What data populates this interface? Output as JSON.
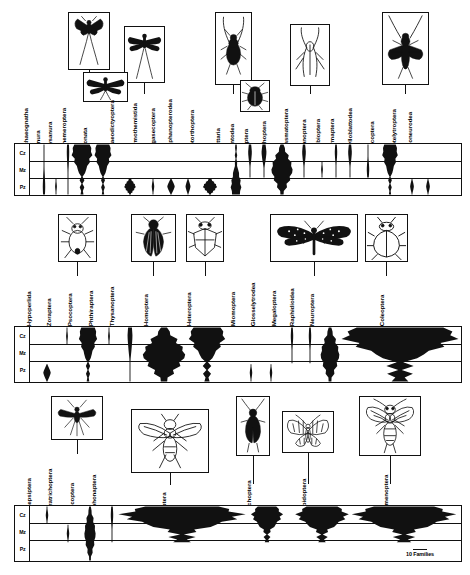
{
  "figure": {
    "scale_bar": {
      "label": "10 Families",
      "units": 10
    }
  },
  "eras": [
    {
      "abbr": "Cz",
      "name": "Cenozoic"
    },
    {
      "abbr": "Mz",
      "name": "Mesozoic"
    },
    {
      "abbr": "Pz",
      "name": "Paleozoic"
    }
  ],
  "chart_data": {
    "type": "area",
    "xlabel": "Insect orders",
    "ylabel": "Geologic era",
    "grid": true,
    "legend": "none",
    "orientation": "vertical-spindle",
    "y_categories": [
      "Cz",
      "Mz",
      "Pz"
    ],
    "scale_note": "Spindle width proportional to number of families; scale bar = 10 Families",
    "panels": [
      {
        "index": 1,
        "categories": [
          "Archaeognatha",
          "Monura",
          "Thysanura",
          "Ephemeroptera",
          "Odonata",
          "Palaeodictyoptera",
          "Permothemistida",
          "Megasecoptera",
          "Diaphanopterodea",
          "Protorthoptera",
          "Blattaria",
          "Mantodea",
          "Isoptera",
          "Orthoptera",
          "Phasmatoptera",
          "Titanoptera",
          "Embioptera",
          "Dermaptera",
          "Grylloblattodea",
          "Plecoptera",
          "Protelytroptera",
          "Caloneurodea"
        ],
        "series": [
          {
            "name": "Archaeognatha",
            "range": [
              "Pz",
              "Cz"
            ],
            "peak_families": 2,
            "peak_era": "Pz"
          },
          {
            "name": "Monura",
            "range": [
              "Pz",
              "Pz"
            ],
            "peak_families": 1,
            "peak_era": "Pz"
          },
          {
            "name": "Thysanura",
            "range": [
              "Pz",
              "Cz"
            ],
            "peak_families": 2,
            "peak_era": "Cz"
          },
          {
            "name": "Ephemeroptera",
            "range": [
              "Pz",
              "Cz"
            ],
            "peak_families": 16,
            "peak_era": "Cz"
          },
          {
            "name": "Odonata",
            "range": [
              "Pz",
              "Cz"
            ],
            "peak_families": 13,
            "peak_era": "Cz"
          },
          {
            "name": "Palaeodictyoptera",
            "range": [
              "Pz",
              "Pz"
            ],
            "peak_families": 9,
            "peak_era": "Pz"
          },
          {
            "name": "Permothemistida",
            "range": [
              "Pz",
              "Pz"
            ],
            "peak_families": 2,
            "peak_era": "Pz"
          },
          {
            "name": "Megasecoptera",
            "range": [
              "Pz",
              "Pz"
            ],
            "peak_families": 6,
            "peak_era": "Pz"
          },
          {
            "name": "Diaphanopterodea",
            "range": [
              "Pz",
              "Pz"
            ],
            "peak_families": 4,
            "peak_era": "Pz"
          },
          {
            "name": "Protorthoptera",
            "range": [
              "Pz",
              "Pz"
            ],
            "peak_families": 11,
            "peak_era": "Pz"
          },
          {
            "name": "Blattaria",
            "range": [
              "Pz",
              "Cz"
            ],
            "peak_families": 8,
            "peak_era": "Pz"
          },
          {
            "name": "Mantodea",
            "range": [
              "Mz",
              "Cz"
            ],
            "peak_families": 3,
            "peak_era": "Cz"
          },
          {
            "name": "Isoptera",
            "range": [
              "Mz",
              "Cz"
            ],
            "peak_families": 4,
            "peak_era": "Cz"
          },
          {
            "name": "Orthoptera",
            "range": [
              "Pz",
              "Cz"
            ],
            "peak_families": 17,
            "peak_era": "Mz"
          },
          {
            "name": "Phasmatoptera",
            "range": [
              "Mz",
              "Cz"
            ],
            "peak_families": 3,
            "peak_era": "Cz"
          },
          {
            "name": "Titanoptera",
            "range": [
              "Mz",
              "Mz"
            ],
            "peak_families": 1,
            "peak_era": "Mz"
          },
          {
            "name": "Embioptera",
            "range": [
              "Mz",
              "Cz"
            ],
            "peak_families": 2,
            "peak_era": "Cz"
          },
          {
            "name": "Dermaptera",
            "range": [
              "Mz",
              "Cz"
            ],
            "peak_families": 3,
            "peak_era": "Cz"
          },
          {
            "name": "Grylloblattodea",
            "range": [
              "Mz",
              "Cz"
            ],
            "peak_families": 2,
            "peak_era": "Mz"
          },
          {
            "name": "Plecoptera",
            "range": [
              "Pz",
              "Cz"
            ],
            "peak_families": 12,
            "peak_era": "Cz"
          },
          {
            "name": "Protelytroptera",
            "range": [
              "Pz",
              "Pz"
            ],
            "peak_families": 3,
            "peak_era": "Pz"
          },
          {
            "name": "Caloneurodea",
            "range": [
              "Pz",
              "Pz"
            ],
            "peak_families": 3,
            "peak_era": "Pz"
          }
        ]
      },
      {
        "index": 2,
        "categories": [
          "Hypoperlida",
          "Zoraptera",
          "Psocoptera",
          "Phthiraptera",
          "Thysanoptera",
          "Homoptera",
          "Heteroptera",
          "Miomoptera",
          "Glosselytrodea",
          "Megaloptera",
          "Raphidioidea",
          "Neuroptera",
          "Coleoptera"
        ],
        "series": [
          {
            "name": "Hypoperlida",
            "range": [
              "Pz",
              "Pz"
            ],
            "peak_families": 6,
            "peak_era": "Pz"
          },
          {
            "name": "Zoraptera",
            "range": [
              "Cz",
              "Cz"
            ],
            "peak_families": 1,
            "peak_era": "Cz"
          },
          {
            "name": "Psocoptera",
            "range": [
              "Pz",
              "Cz"
            ],
            "peak_families": 14,
            "peak_era": "Cz"
          },
          {
            "name": "Phthiraptera",
            "range": [
              "Cz",
              "Cz"
            ],
            "peak_families": 1,
            "peak_era": "Cz"
          },
          {
            "name": "Thysanoptera",
            "range": [
              "Pz",
              "Cz"
            ],
            "peak_families": 4,
            "peak_era": "Cz"
          },
          {
            "name": "Homoptera",
            "range": [
              "Pz",
              "Cz"
            ],
            "peak_families": 34,
            "peak_era": "Mz"
          },
          {
            "name": "Heteroptera",
            "range": [
              "Pz",
              "Cz"
            ],
            "peak_families": 28,
            "peak_era": "Cz"
          },
          {
            "name": "Miomoptera",
            "range": [
              "Pz",
              "Pz"
            ],
            "peak_families": 2,
            "peak_era": "Pz"
          },
          {
            "name": "Glosselytrodea",
            "range": [
              "Pz",
              "Pz"
            ],
            "peak_families": 2,
            "peak_era": "Pz"
          },
          {
            "name": "Megaloptera",
            "range": [
              "Mz",
              "Cz"
            ],
            "peak_families": 2,
            "peak_era": "Cz"
          },
          {
            "name": "Raphidioidea",
            "range": [
              "Mz",
              "Cz"
            ],
            "peak_families": 2,
            "peak_era": "Cz"
          },
          {
            "name": "Neuroptera",
            "range": [
              "Pz",
              "Cz"
            ],
            "peak_families": 15,
            "peak_era": "Mz"
          },
          {
            "name": "Coleoptera",
            "range": [
              "Pz",
              "Cz"
            ],
            "peak_families": 90,
            "peak_era": "Cz"
          }
        ]
      },
      {
        "index": 3,
        "categories": [
          "Strepsiptera",
          "Paratrichoptera",
          "Mecoptera",
          "Siphonaptera",
          "Diptera",
          "Trichoptera",
          "Lepidoptera",
          "Hymenoptera"
        ],
        "series": [
          {
            "name": "Strepsiptera",
            "range": [
              "Cz",
              "Cz"
            ],
            "peak_families": 2,
            "peak_era": "Cz"
          },
          {
            "name": "Paratrichoptera",
            "range": [
              "Mz",
              "Mz"
            ],
            "peak_families": 2,
            "peak_era": "Mz"
          },
          {
            "name": "Mecoptera",
            "range": [
              "Pz",
              "Cz"
            ],
            "peak_families": 9,
            "peak_era": "Mz"
          },
          {
            "name": "Siphonaptera",
            "range": [
              "Mz",
              "Cz"
            ],
            "peak_families": 2,
            "peak_era": "Cz"
          },
          {
            "name": "Diptera",
            "range": [
              "Mz",
              "Cz"
            ],
            "peak_families": 95,
            "peak_era": "Cz"
          },
          {
            "name": "Trichoptera",
            "range": [
              "Mz",
              "Cz"
            ],
            "peak_families": 24,
            "peak_era": "Cz"
          },
          {
            "name": "Lepidoptera",
            "range": [
              "Mz",
              "Cz"
            ],
            "peak_families": 40,
            "peak_era": "Cz"
          },
          {
            "name": "Hymenoptera",
            "range": [
              "Mz",
              "Cz"
            ],
            "peak_families": 78,
            "peak_era": "Cz"
          }
        ]
      }
    ]
  },
  "illustrations": [
    {
      "id": "mayfly",
      "order": "Ephemeroptera",
      "panel": 1
    },
    {
      "id": "dragonfly-1",
      "order": "Odonata",
      "panel": 1
    },
    {
      "id": "dragonfly-2",
      "order": "Palaeodictyoptera",
      "panel": 1
    },
    {
      "id": "protorthopteran",
      "order": "Protorthoptera",
      "panel": 1
    },
    {
      "id": "cockroach",
      "order": "Blattaria",
      "panel": 1
    },
    {
      "id": "grasshopper",
      "order": "Orthoptera",
      "panel": 1
    },
    {
      "id": "stonefly",
      "order": "Plecoptera",
      "panel": 1
    },
    {
      "id": "barklouse",
      "order": "Psocoptera",
      "panel": 2
    },
    {
      "id": "planthopper",
      "order": "Homoptera",
      "panel": 2
    },
    {
      "id": "truebug",
      "order": "Heteroptera",
      "panel": 2
    },
    {
      "id": "lacewing",
      "order": "Neuroptera",
      "panel": 2
    },
    {
      "id": "beetle",
      "order": "Coleoptera",
      "panel": 2
    },
    {
      "id": "scorpionfly",
      "order": "Mecoptera",
      "panel": 3
    },
    {
      "id": "fly",
      "order": "Diptera",
      "panel": 3
    },
    {
      "id": "caddisfly",
      "order": "Trichoptera",
      "panel": 3
    },
    {
      "id": "moth",
      "order": "Lepidoptera",
      "panel": 3
    },
    {
      "id": "wasp",
      "order": "Hymenoptera",
      "panel": 3
    }
  ],
  "colors": {
    "ink": "#000000",
    "paper": "#ffffff",
    "fill": "#111111"
  }
}
